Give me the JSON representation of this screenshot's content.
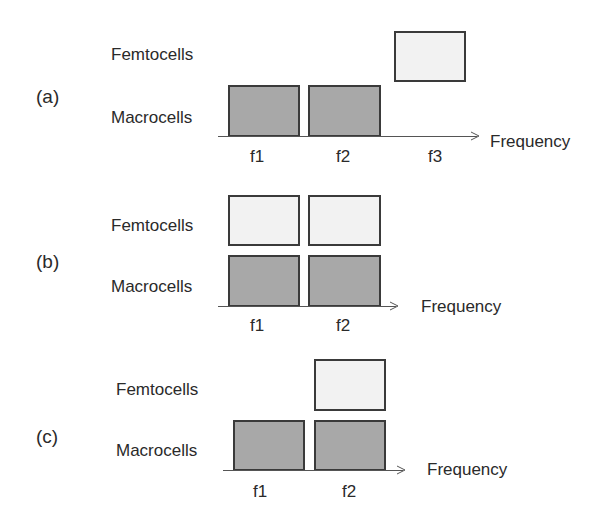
{
  "diagram": {
    "title": "",
    "colors": {
      "macrocell_fill": "#a8a8a8",
      "femtocell_fill": "#f2f2f2",
      "border": "#3a3a3a",
      "text": "#2a2a2a"
    },
    "panels": [
      {
        "id": "a",
        "label": "(a)",
        "row_labels": {
          "femto": "Femtocells",
          "macro": "Macrocells"
        },
        "axis_label": "Frequency",
        "ticks": [
          "f1",
          "f2",
          "f3"
        ],
        "macrocells": [
          "f1",
          "f2"
        ],
        "femtocells": [
          "f3"
        ]
      },
      {
        "id": "b",
        "label": "(b)",
        "row_labels": {
          "femto": "Femtocells",
          "macro": "Macrocells"
        },
        "axis_label": "Frequency",
        "ticks": [
          "f1",
          "f2"
        ],
        "macrocells": [
          "f1",
          "f2"
        ],
        "femtocells": [
          "f1",
          "f2"
        ]
      },
      {
        "id": "c",
        "label": "(c)",
        "row_labels": {
          "femto": "Femtocells",
          "macro": "Macrocells"
        },
        "axis_label": "Frequency",
        "ticks": [
          "f1",
          "f2"
        ],
        "macrocells": [
          "f1",
          "f2"
        ],
        "femtocells": [
          "f2"
        ]
      }
    ]
  }
}
